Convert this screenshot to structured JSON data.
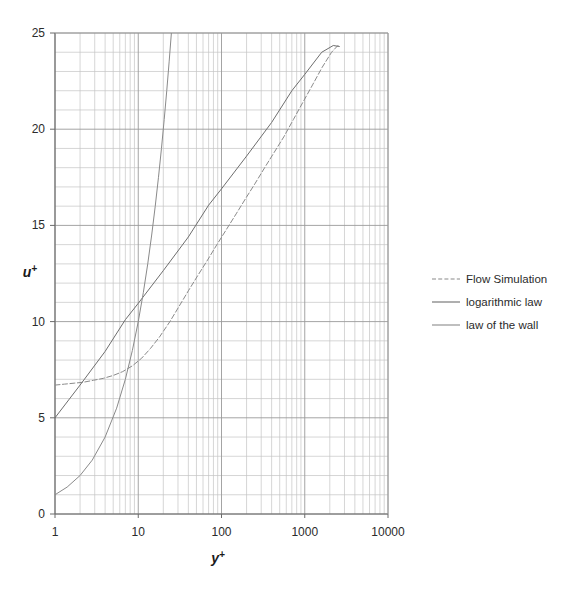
{
  "chart_data": {
    "type": "line",
    "title": "",
    "xlabel": "y+",
    "ylabel": "u+",
    "xscale": "log",
    "yscale": "linear",
    "xlim": [
      1,
      10000
    ],
    "ylim": [
      0,
      25
    ],
    "grid": true,
    "legend_position": "right",
    "x_tick_labels": [
      "1",
      "10",
      "100",
      "1000",
      "10000"
    ],
    "x_tick_values": [
      1,
      10,
      100,
      1000,
      10000
    ],
    "y_tick_labels": [
      "0",
      "5",
      "10",
      "15",
      "20",
      "25"
    ],
    "y_tick_values": [
      0,
      5,
      10,
      15,
      20,
      25
    ],
    "y_minor_step": 1,
    "series": [
      {
        "name": "Flow Simulation",
        "style": "dashed",
        "color": "#8a8a8a",
        "x": [
          1,
          1.3,
          1.7,
          2.2,
          2.9,
          3.8,
          5,
          6.5,
          8.5,
          11,
          14,
          18,
          24,
          31,
          40,
          52,
          68,
          88,
          115,
          150,
          195,
          255,
          330,
          430,
          560,
          730,
          950,
          1240,
          1610,
          2100,
          2500
        ],
        "y": [
          6.7,
          6.75,
          6.8,
          6.85,
          6.95,
          7.05,
          7.2,
          7.4,
          7.7,
          8.1,
          8.6,
          9.2,
          10.0,
          10.8,
          11.6,
          12.4,
          13.2,
          14.0,
          14.8,
          15.6,
          16.4,
          17.2,
          18.0,
          18.8,
          19.6,
          20.5,
          21.4,
          22.3,
          23.2,
          24.0,
          24.35
        ]
      },
      {
        "name": "logarithmic law",
        "style": "solid",
        "color": "#6e6e6e",
        "x": [
          1,
          2,
          4,
          7,
          10,
          20,
          40,
          70,
          100,
          200,
          400,
          700,
          1000,
          1600,
          2200,
          2600
        ],
        "y": [
          5.0,
          6.7,
          8.45,
          10.1,
          10.95,
          12.65,
          14.4,
          16.05,
          16.9,
          18.6,
          20.35,
          22.0,
          22.85,
          24.0,
          24.35,
          24.3
        ]
      },
      {
        "name": "law of the wall",
        "style": "solid",
        "color": "#8a8a8a",
        "x": [
          1,
          1.4,
          2,
          2.8,
          4,
          5.5,
          7,
          8.5,
          10,
          11.5,
          13,
          14.5,
          16,
          17.5,
          19,
          20.5,
          22,
          23.5,
          25
        ],
        "y": [
          1.0,
          1.4,
          2.0,
          2.8,
          4.0,
          5.5,
          7.0,
          8.5,
          10.0,
          11.5,
          13.0,
          14.5,
          16.0,
          17.5,
          19.0,
          20.5,
          22.0,
          23.5,
          25.0
        ]
      }
    ]
  },
  "legend": {
    "items": [
      {
        "label": "Flow Simulation"
      },
      {
        "label": "logarithmic law"
      },
      {
        "label": "law of the wall"
      }
    ]
  },
  "axis": {
    "x_title_base": "y",
    "x_title_sup": "+",
    "y_title_base": "u",
    "y_title_sup": "+"
  },
  "colors": {
    "grid_major": "#9a9a9a",
    "grid_minor": "#c4c4c4",
    "axis": "#6b6b6b",
    "text": "#2b2b2b",
    "background": "#ffffff"
  }
}
